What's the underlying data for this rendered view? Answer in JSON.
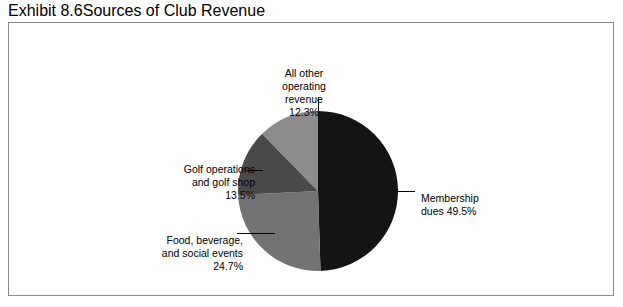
{
  "exhibit": {
    "number": "Exhibit 8.6",
    "title": "Sources of Club Revenue"
  },
  "chart_data": {
    "type": "pie",
    "title": "Sources of Club Revenue",
    "xlabel": "",
    "ylabel": "",
    "legend_position": "none",
    "grid": false,
    "start_angle_deg": 0,
    "direction": "clockwise",
    "categories": [
      "Membership dues",
      "Food, beverage, and social events",
      "Golf operations and golf shop",
      "All other operating revenue"
    ],
    "values": [
      49.5,
      24.7,
      13.5,
      12.3
    ],
    "unit": "%",
    "colors": [
      "#141414",
      "#737373",
      "#4a4a4a",
      "#8c8c8c"
    ],
    "slices": [
      {
        "name": "Membership dues",
        "value": 49.5,
        "value_label": "49.5%",
        "color": "#141414",
        "label_line1": "Membership",
        "label_line2": "dues 49.5%"
      },
      {
        "name": "Food, beverage, and social events",
        "value": 24.7,
        "value_label": "24.7%",
        "color": "#737373",
        "label_line1": "Food, beverage,",
        "label_line2": "and social events",
        "label_line3": "24.7%"
      },
      {
        "name": "Golf operations and golf shop",
        "value": 13.5,
        "value_label": "13.5%",
        "color": "#4a4a4a",
        "label_line1": "Golf operations",
        "label_line2": "and golf shop",
        "label_line3": "13.5%"
      },
      {
        "name": "All other operating revenue",
        "value": 12.3,
        "value_label": "12.3%",
        "color": "#8c8c8c",
        "label_line1": "All other",
        "label_line2": "operating",
        "label_line3": "revenue",
        "label_line4": "12.3%"
      }
    ]
  }
}
